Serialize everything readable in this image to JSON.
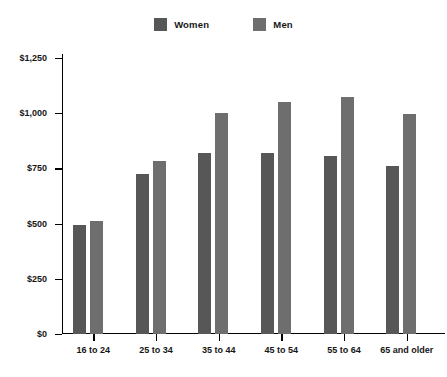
{
  "chart_data": {
    "type": "bar",
    "title": "",
    "xlabel": "",
    "ylabel": "",
    "ylim": [
      0,
      1250
    ],
    "grid": false,
    "legend_position": "top-center",
    "categories": [
      "16 to 24",
      "25 to 34",
      "35 to 44",
      "45 to 54",
      "55 to 64",
      "65 and older"
    ],
    "ytick_labels": [
      "$0",
      "$250",
      "$500",
      "$750",
      "$1,000",
      "$1,250"
    ],
    "ytick_values": [
      0,
      250,
      500,
      750,
      1000,
      1250
    ],
    "series": [
      {
        "name": "Women",
        "color": "#575757",
        "values": [
          495,
          725,
          820,
          820,
          805,
          760
        ]
      },
      {
        "name": "Men",
        "color": "#6e6e6e",
        "values": [
          510,
          785,
          1000,
          1050,
          1075,
          995
        ]
      }
    ]
  },
  "legend": {
    "items": [
      {
        "label": "Women",
        "color": "#575757"
      },
      {
        "label": "Men",
        "color": "#6e6e6e"
      }
    ]
  },
  "colors": {
    "women": "#575757",
    "men": "#6e6e6e",
    "axis": "#000000",
    "text": "#161616",
    "background": "#ffffff"
  }
}
